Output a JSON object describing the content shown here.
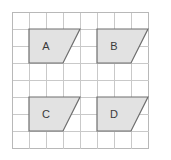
{
  "figure": {
    "background_color": "#ffffff",
    "grid": {
      "columns": 8,
      "rows": 8,
      "cell_size_px": 17,
      "origin_x_px": 12,
      "origin_y_px": 12,
      "line_color": "#c9c9c9",
      "frame_color": "#b8b8b8"
    },
    "shape_style": {
      "fill_color": "#e2e2e2",
      "stroke_color": "#6e6e6e",
      "label_color": "#3a3a3a"
    },
    "shapes": [
      {
        "label": "A",
        "type": "right-trapezoid",
        "points": "29,29 63,29 80,29 63,63 29,63",
        "outline": "29,29 80,29 63,63 29,63",
        "label_x": 46,
        "label_y": 46
      },
      {
        "label": "B",
        "type": "right-trapezoid",
        "points": "97,29 131,29 148,29 131,63 97,63",
        "outline": "97,29 148,29 131,63 97,63",
        "label_x": 114,
        "label_y": 46
      },
      {
        "label": "C",
        "type": "right-trapezoid",
        "points": "29,97 63,97 80,97 63,131 29,131",
        "outline": "29,97 80,97 63,131 29,131",
        "label_x": 46,
        "label_y": 114
      },
      {
        "label": "D",
        "type": "right-trapezoid",
        "points": "97,97 131,97 148,97 131,131 97,131",
        "outline": "97,97 148,97 131,131 97,131",
        "label_x": 114,
        "label_y": 114
      }
    ]
  }
}
